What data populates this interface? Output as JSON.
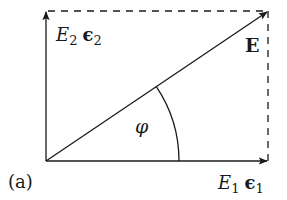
{
  "diagram": {
    "panel_label": "(a)",
    "vector_label": "E",
    "angle_label": "φ",
    "x_component": {
      "symbol": "E",
      "subscript": "1",
      "unit_symbol": "ϵ",
      "unit_subscript": "1"
    },
    "y_component": {
      "symbol": "E",
      "subscript": "2",
      "unit_symbol": "ϵ",
      "unit_subscript": "2"
    },
    "colors": {
      "line": "#1a1a1a",
      "background": "#ffffff"
    }
  }
}
